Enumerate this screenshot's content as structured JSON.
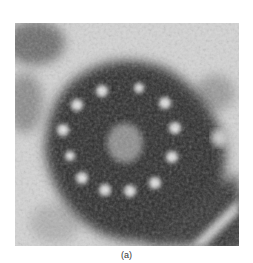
{
  "figure": {
    "caption": "(a)",
    "colors": {
      "background": "#d9d9d9",
      "matrix_dark": "#2a2a2a",
      "tubule_light": "#e6e6e6"
    }
  }
}
